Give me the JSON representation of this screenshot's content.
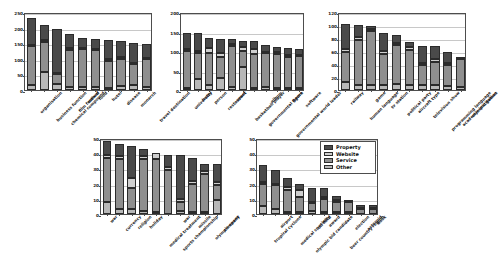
{
  "figure": {
    "title": "",
    "background": "#ffffff",
    "panel_count": 5
  },
  "legend": {
    "position": "inside-top-right-of-panel-5",
    "entries": [
      {
        "label": "Property",
        "color": "#4a4a4a"
      },
      {
        "label": "Website",
        "color": "#cfcfcf"
      },
      {
        "label": "Service",
        "color": "#8f8f8f"
      },
      {
        "label": "Other",
        "color": "#b8b8b8"
      }
    ]
  },
  "chart_data": [
    {
      "type": "bar",
      "stacked": true,
      "title": "",
      "xlabel": "",
      "ylabel": "",
      "ylim": [
        0,
        250
      ],
      "yticks": [
        0,
        50,
        100,
        150,
        200,
        250
      ],
      "grid": true,
      "categories": [
        "organisation",
        "business function",
        "chemical compound",
        "film festival",
        "award",
        "food",
        "hotel",
        "disease",
        "monarch",
        "travel destination"
      ],
      "series": [
        {
          "name": "Other",
          "values": [
            16,
            57,
            19,
            11,
            11,
            10,
            8,
            13,
            16,
            10
          ]
        },
        {
          "name": "Service",
          "values": [
            124,
            96,
            32,
            118,
            119,
            117,
            86,
            87,
            66,
            88
          ]
        },
        {
          "name": "Website",
          "values": [
            5,
            6,
            4,
            7,
            6,
            6,
            6,
            5,
            4,
            4
          ]
        },
        {
          "name": "Property",
          "values": [
            87,
            48,
            140,
            42,
            32,
            30,
            60,
            53,
            64,
            46
          ]
        }
      ],
      "totals": [
        232,
        207,
        195,
        178,
        168,
        163,
        160,
        158,
        150,
        148
      ]
    },
    {
      "type": "bar",
      "stacked": true,
      "title": "",
      "xlabel": "",
      "ylabel": "",
      "ylim": [
        0,
        200
      ],
      "yticks": [
        0,
        50,
        100,
        150,
        200
      ],
      "grid": true,
      "categories": [
        "university",
        "hotel",
        "person",
        "restaurant",
        "sport",
        "basketball player",
        "governmental figure",
        "album",
        "governmental world leader",
        "game",
        "software"
      ],
      "series": [
        {
          "name": "Other",
          "values": [
            5,
            28,
            12,
            31,
            9,
            60,
            6,
            7,
            5,
            5,
            5
          ]
        },
        {
          "name": "Service",
          "values": [
            95,
            68,
            83,
            54,
            105,
            41,
            86,
            87,
            88,
            80,
            81
          ]
        },
        {
          "name": "Website",
          "values": [
            5,
            5,
            12,
            11,
            4,
            10,
            12,
            4,
            4,
            5,
            4
          ]
        },
        {
          "name": "Property",
          "values": [
            42,
            44,
            26,
            36,
            12,
            15,
            22,
            17,
            13,
            17,
            16
          ]
        }
      ],
      "totals": [
        147,
        145,
        133,
        132,
        130,
        126,
        126,
        115,
        110,
        107,
        106
      ]
    },
    {
      "type": "bar",
      "stacked": true,
      "title": "",
      "xlabel": "",
      "ylabel": "",
      "ylim": [
        0,
        120
      ],
      "yticks": [
        0,
        20,
        40,
        60,
        80,
        100,
        120
      ],
      "grid": true,
      "categories": [
        "railway",
        "human language",
        "game",
        "tv station",
        "political party",
        "aircraft type",
        "television show",
        "programming language",
        "academic institution",
        "olympic games"
      ],
      "series": [
        {
          "name": "Other",
          "values": [
            13,
            8,
            7,
            8,
            9,
            7,
            7,
            8,
            6,
            5
          ]
        },
        {
          "name": "Service",
          "values": [
            46,
            69,
            84,
            48,
            60,
            55,
            31,
            35,
            32,
            42
          ]
        },
        {
          "name": "Website",
          "values": [
            4,
            4,
            3,
            4,
            4,
            4,
            4,
            4,
            4,
            2
          ]
        },
        {
          "name": "Property",
          "values": [
            39,
            19,
            5,
            28,
            12,
            8,
            26,
            20,
            16,
            0
          ]
        }
      ],
      "totals": [
        102,
        100,
        99,
        88,
        85,
        74,
        68,
        67,
        58,
        49
      ]
    },
    {
      "type": "bar",
      "stacked": true,
      "title": "",
      "xlabel": "",
      "ylabel": "",
      "ylim": [
        0,
        50
      ],
      "yticks": [
        0,
        10,
        20,
        30,
        40,
        50
      ],
      "grid": true,
      "categories": [
        "war",
        "currency",
        "religion",
        "holiday",
        "medical treatment",
        "sports championship",
        "war",
        "missile",
        "olympic event",
        "company"
      ],
      "series": [
        {
          "name": "Other",
          "values": [
            8,
            3,
            3,
            2,
            1,
            0,
            2,
            1,
            1,
            9
          ]
        },
        {
          "name": "Service",
          "values": [
            29,
            33,
            14,
            34,
            35,
            29,
            6,
            19,
            25,
            10
          ]
        },
        {
          "name": "Website",
          "values": [
            2,
            2,
            7,
            2,
            4,
            2,
            2,
            2,
            2,
            2
          ]
        },
        {
          "name": "Property",
          "values": [
            9,
            8,
            21,
            5,
            0,
            8,
            29,
            15,
            5,
            12
          ]
        }
      ],
      "totals": [
        48,
        46,
        45,
        43,
        40,
        39,
        39,
        37,
        33,
        33
      ]
    },
    {
      "type": "bar",
      "stacked": true,
      "title": "",
      "xlabel": "",
      "ylabel": "",
      "ylim": [
        0,
        50
      ],
      "yticks": [
        0,
        10,
        20,
        30,
        40,
        50
      ],
      "grid": true,
      "categories": [
        "tropical cyclone",
        "airport",
        "medical specialty",
        "olympic bid candidate",
        "oil field",
        "award",
        "beer country region",
        "election",
        "asteroid",
        "book"
      ],
      "series": [
        {
          "name": "Other",
          "values": [
            5,
            3,
            1,
            1,
            2,
            1,
            1,
            1,
            0,
            0
          ]
        },
        {
          "name": "Service",
          "values": [
            15,
            16,
            15,
            10,
            5,
            9,
            7,
            7,
            3,
            3
          ]
        },
        {
          "name": "Website",
          "values": [
            1,
            1,
            2,
            5,
            1,
            1,
            1,
            1,
            1,
            1
          ]
        },
        {
          "name": "Property",
          "values": [
            11,
            9,
            6,
            4,
            9,
            6,
            3,
            0,
            2,
            2
          ]
        }
      ],
      "totals": [
        32,
        29,
        24,
        20,
        17,
        17,
        12,
        9,
        6,
        6
      ]
    }
  ]
}
